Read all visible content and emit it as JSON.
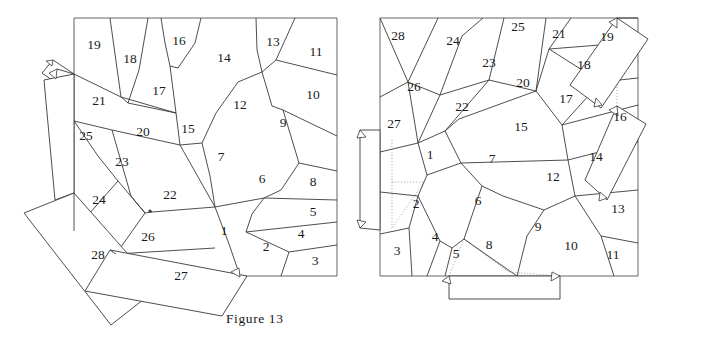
{
  "page": {
    "background_color": "#ffffff",
    "line_color": "#3a3a3a",
    "dotted_line_color": "#9a9a9a",
    "text_color": "#1a1a1a",
    "width": 713,
    "height": 341
  },
  "figures": [
    {
      "id": "figure-13",
      "caption": "Figure 13",
      "caption_position": {
        "x": 226,
        "y": 311
      },
      "cell_count": 28,
      "description": "Square dissection diagram with 28 numbered regions; several regions are folded outward as flaps on the left and bottom-left, indicated by arrows and dotted fold lines.",
      "frame": {
        "x": 74,
        "y": 18,
        "width": 263,
        "height": 258
      },
      "cell_labels": [
        {
          "n": "1",
          "x": 224,
          "y": 232
        },
        {
          "n": "2",
          "x": 266,
          "y": 248
        },
        {
          "n": "3",
          "x": 315,
          "y": 262
        },
        {
          "n": "4",
          "x": 301,
          "y": 235
        },
        {
          "n": "5",
          "x": 313,
          "y": 213
        },
        {
          "n": "6",
          "x": 262,
          "y": 180
        },
        {
          "n": "7",
          "x": 221,
          "y": 158
        },
        {
          "n": "8",
          "x": 313,
          "y": 183
        },
        {
          "n": "9",
          "x": 283,
          "y": 124
        },
        {
          "n": "10",
          "x": 313,
          "y": 96
        },
        {
          "n": "11",
          "x": 316,
          "y": 53
        },
        {
          "n": "12",
          "x": 240,
          "y": 106
        },
        {
          "n": "13",
          "x": 273,
          "y": 43
        },
        {
          "n": "14",
          "x": 224,
          "y": 59
        },
        {
          "n": "15",
          "x": 188,
          "y": 130
        },
        {
          "n": "16",
          "x": 179,
          "y": 42
        },
        {
          "n": "17",
          "x": 159,
          "y": 92
        },
        {
          "n": "18",
          "x": 130,
          "y": 60
        },
        {
          "n": "19",
          "x": 94,
          "y": 46
        },
        {
          "n": "20",
          "x": 143,
          "y": 133
        },
        {
          "n": "21",
          "x": 99,
          "y": 102
        },
        {
          "n": "22",
          "x": 170,
          "y": 196
        },
        {
          "n": "23",
          "x": 122,
          "y": 163
        },
        {
          "n": "24",
          "x": 99,
          "y": 201
        },
        {
          "n": "25",
          "x": 86,
          "y": 137
        },
        {
          "n": "26",
          "x": 148,
          "y": 238
        },
        {
          "n": "27",
          "x": 181,
          "y": 277
        },
        {
          "n": "28",
          "x": 98,
          "y": 256
        }
      ]
    },
    {
      "id": "figure-14",
      "caption": "Figure 14",
      "caption_position": {
        "x": 489,
        "y": 311
      },
      "cell_count": 28,
      "description": "Square dissection diagram with 28 numbered regions; two flaps folded out on the right edge, one flap on the left edge and one flap folded below the bottom edge, with dotted fold lines and arrowheads.",
      "frame": {
        "x": 380,
        "y": 18,
        "width": 258,
        "height": 258
      },
      "cell_labels": [
        {
          "n": "1",
          "x": 430,
          "y": 156
        },
        {
          "n": "2",
          "x": 416,
          "y": 205
        },
        {
          "n": "3",
          "x": 397,
          "y": 252
        },
        {
          "n": "4",
          "x": 435,
          "y": 238
        },
        {
          "n": "5",
          "x": 456,
          "y": 255
        },
        {
          "n": "6",
          "x": 478,
          "y": 202
        },
        {
          "n": "7",
          "x": 492,
          "y": 160
        },
        {
          "n": "8",
          "x": 489,
          "y": 246
        },
        {
          "n": "9",
          "x": 538,
          "y": 228
        },
        {
          "n": "10",
          "x": 571,
          "y": 247
        },
        {
          "n": "11",
          "x": 613,
          "y": 256
        },
        {
          "n": "12",
          "x": 553,
          "y": 178
        },
        {
          "n": "13",
          "x": 618,
          "y": 210
        },
        {
          "n": "14",
          "x": 596,
          "y": 158
        },
        {
          "n": "15",
          "x": 521,
          "y": 128
        },
        {
          "n": "16",
          "x": 620,
          "y": 118
        },
        {
          "n": "17",
          "x": 566,
          "y": 100
        },
        {
          "n": "18",
          "x": 584,
          "y": 66
        },
        {
          "n": "19",
          "x": 607,
          "y": 38
        },
        {
          "n": "20",
          "x": 523,
          "y": 84
        },
        {
          "n": "21",
          "x": 559,
          "y": 35
        },
        {
          "n": "22",
          "x": 462,
          "y": 108
        },
        {
          "n": "23",
          "x": 489,
          "y": 64
        },
        {
          "n": "24",
          "x": 453,
          "y": 42
        },
        {
          "n": "25",
          "x": 518,
          "y": 28
        },
        {
          "n": "26",
          "x": 414,
          "y": 88
        },
        {
          "n": "27",
          "x": 394,
          "y": 125
        },
        {
          "n": "28",
          "x": 398,
          "y": 37
        }
      ]
    }
  ]
}
